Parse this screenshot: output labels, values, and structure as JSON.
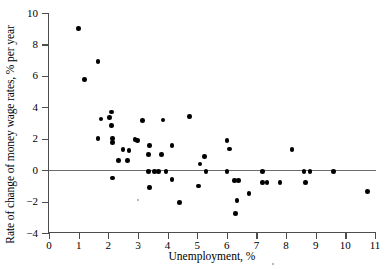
{
  "chart_data": {
    "type": "scatter",
    "title": "",
    "xlabel": "Unemployment, %",
    "ylabel": "Rate of change of money wage rates, % per year",
    "xlim": [
      0,
      11
    ],
    "ylim": [
      -4,
      10
    ],
    "xticks": [
      0,
      1,
      2,
      3,
      4,
      5,
      6,
      7,
      8,
      9,
      10,
      11
    ],
    "yticks": [
      -4,
      -2,
      0,
      2,
      4,
      6,
      8,
      10
    ],
    "xticklabels": [
      "0",
      "1",
      "2",
      "3",
      "4",
      "5",
      "6",
      "7",
      "8",
      "9",
      "10",
      "11"
    ],
    "yticklabels": [
      "−4",
      "−2",
      "0",
      "2",
      "4",
      "6",
      "8",
      "10"
    ],
    "grid": false,
    "legend": null,
    "marker": "filled-circle",
    "marker_color": "#000000",
    "reference_lines": [
      {
        "name": "zero-line",
        "orientation": "horizontal",
        "value": 0,
        "color": "#6b6b6b"
      }
    ],
    "points": [
      {
        "x": 1.0,
        "y": 9.0
      },
      {
        "x": 1.65,
        "y": 6.9
      },
      {
        "x": 1.2,
        "y": 5.75
      },
      {
        "x": 2.1,
        "y": 3.7
      },
      {
        "x": 1.75,
        "y": 3.25
      },
      {
        "x": 2.05,
        "y": 3.35
      },
      {
        "x": 2.1,
        "y": 2.85
      },
      {
        "x": 1.65,
        "y": 2.0
      },
      {
        "x": 2.15,
        "y": 2.0
      },
      {
        "x": 2.15,
        "y": 1.75
      },
      {
        "x": 2.5,
        "y": 1.3
      },
      {
        "x": 2.7,
        "y": 1.25
      },
      {
        "x": 2.35,
        "y": 0.6
      },
      {
        "x": 2.65,
        "y": 0.6
      },
      {
        "x": 2.15,
        "y": -0.5
      },
      {
        "x": 2.9,
        "y": 1.95
      },
      {
        "x": 2.98,
        "y": 1.9
      },
      {
        "x": 3.15,
        "y": 3.15
      },
      {
        "x": 3.4,
        "y": 1.55
      },
      {
        "x": 3.35,
        "y": 1.0
      },
      {
        "x": 3.85,
        "y": 3.2
      },
      {
        "x": 3.8,
        "y": 1.0
      },
      {
        "x": 3.35,
        "y": -0.1
      },
      {
        "x": 3.55,
        "y": -0.1
      },
      {
        "x": 3.7,
        "y": -0.1
      },
      {
        "x": 3.95,
        "y": -0.1
      },
      {
        "x": 3.4,
        "y": -1.1
      },
      {
        "x": 4.15,
        "y": 1.55
      },
      {
        "x": 4.15,
        "y": -0.6
      },
      {
        "x": 4.4,
        "y": -2.05
      },
      {
        "x": 4.75,
        "y": 3.4
      },
      {
        "x": 5.1,
        "y": 0.4
      },
      {
        "x": 5.25,
        "y": 0.85
      },
      {
        "x": 5.3,
        "y": -0.1
      },
      {
        "x": 5.05,
        "y": -1.0
      },
      {
        "x": 6.0,
        "y": 1.9
      },
      {
        "x": 6.1,
        "y": 1.35
      },
      {
        "x": 6.0,
        "y": -0.1
      },
      {
        "x": 6.25,
        "y": -0.65
      },
      {
        "x": 6.4,
        "y": -0.65
      },
      {
        "x": 6.35,
        "y": -1.95
      },
      {
        "x": 6.3,
        "y": -2.75
      },
      {
        "x": 6.75,
        "y": -1.5
      },
      {
        "x": 7.2,
        "y": -0.1
      },
      {
        "x": 7.2,
        "y": -0.8
      },
      {
        "x": 7.35,
        "y": -0.8
      },
      {
        "x": 7.8,
        "y": -0.8
      },
      {
        "x": 8.2,
        "y": 1.3
      },
      {
        "x": 8.6,
        "y": -0.1
      },
      {
        "x": 8.8,
        "y": -0.1
      },
      {
        "x": 8.65,
        "y": -0.8
      },
      {
        "x": 9.6,
        "y": -0.1
      },
      {
        "x": 10.75,
        "y": -1.35
      }
    ]
  },
  "axes": {
    "x_title": "Unemployment, %",
    "y_title": "Rate of change of money wage rates, % per year"
  }
}
